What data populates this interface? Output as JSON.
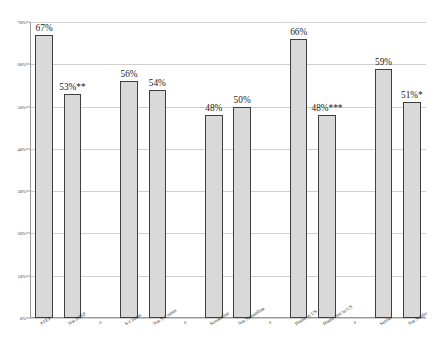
{
  "chart_data": {
    "type": "bar",
    "title": "",
    "subtitle": "",
    "xlabel": "",
    "ylabel": "",
    "ylim": [
      0,
      70
    ],
    "ytick_labels": [
      "0%",
      "10%",
      "20%",
      "30%",
      "40%",
      "50%",
      "60%",
      "70%"
    ],
    "ytick_values": [
      0,
      10,
      20,
      30,
      40,
      50,
      60,
      70
    ],
    "grid": true,
    "legend": "none",
    "categories": [
      "ATEP",
      "Not ATEP",
      "0",
      "S-Comm",
      "Not S-Comm",
      "0",
      "Streamline",
      "Not Streamline",
      "0",
      "Home in US",
      "Home Not in US",
      "0",
      "Settler",
      "Not Settler"
    ],
    "values": [
      67,
      53,
      0,
      56,
      54,
      0,
      48,
      50,
      0,
      66,
      48,
      0,
      59,
      51
    ],
    "data_labels": [
      "67%",
      "53%**",
      "",
      "56%",
      "54%",
      "",
      "48%",
      "50%",
      "",
      "66%",
      "48%***",
      "",
      "59%",
      "51%*"
    ],
    "bar_fill_color": "#D9D9D9",
    "bar_border_color": "#3F3F3F",
    "gridline_color": "#D0D0D0",
    "axis_color": "#9A9A9A",
    "background_color": "#FFFFFF",
    "significance_notes": {
      "Not ATEP": "**",
      "Home Not in US": "***",
      "Not Settler": "*"
    }
  }
}
